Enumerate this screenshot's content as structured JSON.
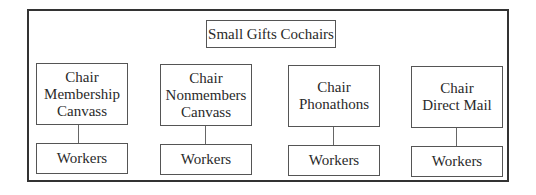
{
  "diagram": {
    "type": "org-chart",
    "root": {
      "label": "Small Gifts Cochairs"
    },
    "chairs": [
      {
        "label": "Chair\nMembership\nCanvass",
        "child": "Workers"
      },
      {
        "label": "Chair\nNonmembers\nCanvass",
        "child": "Workers"
      },
      {
        "label": "Chair\nPhonathons",
        "child": "Workers"
      },
      {
        "label": "Chair\nDirect Mail",
        "child": "Workers"
      }
    ],
    "colors": {
      "border": "#333333",
      "text": "#2a2a2a",
      "background": "#ffffff"
    }
  }
}
